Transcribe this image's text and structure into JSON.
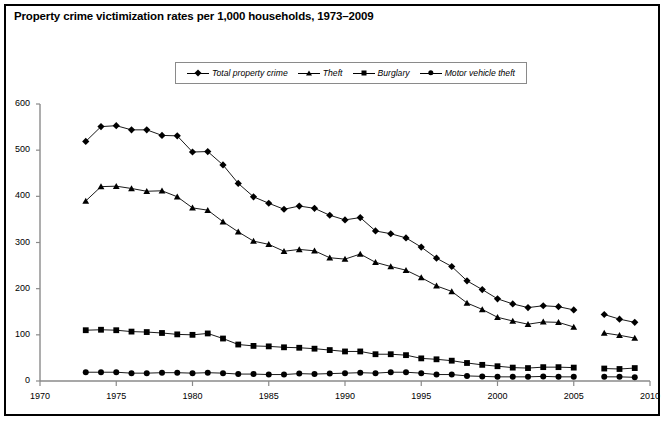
{
  "title": "Property crime victimization rates per 1,000 households, 1973–2009",
  "legend": {
    "items": [
      {
        "label": "Total property crime",
        "marker": "diamond"
      },
      {
        "label": "Theft",
        "marker": "triangle"
      },
      {
        "label": "Burglary",
        "marker": "square"
      },
      {
        "label": "Motor vehicle theft",
        "marker": "circle"
      }
    ]
  },
  "chart_data": {
    "type": "line",
    "title": "Property crime victimization rates per 1,000 households, 1973–2009",
    "xlabel": "",
    "ylabel": "",
    "xlim": [
      1970,
      2010
    ],
    "ylim": [
      0,
      600
    ],
    "xticks": [
      1970,
      1975,
      1980,
      1985,
      1990,
      1995,
      2000,
      2005,
      2010
    ],
    "yticks": [
      0,
      100,
      200,
      300,
      400,
      500,
      600
    ],
    "grid": false,
    "legend_position": "top",
    "note": "Series are broken between 2005 and 2007; a separate segment covers 2007–2009.",
    "x": [
      1973,
      1974,
      1975,
      1976,
      1977,
      1978,
      1979,
      1980,
      1981,
      1982,
      1983,
      1984,
      1985,
      1986,
      1987,
      1988,
      1989,
      1990,
      1991,
      1992,
      1993,
      1994,
      1995,
      1996,
      1997,
      1998,
      1999,
      2000,
      2001,
      2002,
      2003,
      2004,
      2005
    ],
    "x_segment2": [
      2007,
      2008,
      2009
    ],
    "series": [
      {
        "name": "Total property crime",
        "marker": "diamond",
        "values": [
          519,
          551,
          553,
          544,
          544,
          532,
          531,
          496,
          497,
          468,
          428,
          399,
          385,
          372,
          379,
          374,
          359,
          349,
          354,
          325,
          319,
          310,
          290,
          266,
          248,
          217,
          198,
          178,
          167,
          159,
          163,
          161,
          154
        ],
        "values_segment2": [
          144,
          134,
          127
        ]
      },
      {
        "name": "Theft",
        "marker": "triangle",
        "values": [
          390,
          421,
          422,
          417,
          411,
          412,
          399,
          375,
          370,
          345,
          323,
          303,
          296,
          281,
          285,
          282,
          267,
          264,
          275,
          257,
          248,
          240,
          224,
          206,
          194,
          169,
          155,
          138,
          130,
          123,
          128,
          127,
          117
        ],
        "values_segment2": [
          104,
          99,
          93
        ]
      },
      {
        "name": "Burglary",
        "marker": "square",
        "values": [
          110,
          111,
          110,
          107,
          106,
          104,
          101,
          100,
          103,
          92,
          79,
          76,
          75,
          73,
          72,
          70,
          67,
          64,
          64,
          58,
          58,
          56,
          49,
          47,
          44,
          39,
          35,
          32,
          29,
          28,
          30,
          30,
          29
        ],
        "values_segment2": [
          27,
          26,
          28
        ]
      },
      {
        "name": "Motor vehicle theft",
        "marker": "circle",
        "values": [
          19,
          19,
          19,
          17,
          17,
          18,
          18,
          17,
          18,
          17,
          15,
          15,
          14,
          14,
          16,
          15,
          16,
          17,
          18,
          17,
          19,
          19,
          17,
          14,
          14,
          11,
          10,
          9,
          9,
          9,
          10,
          9,
          9
        ],
        "values_segment2": [
          9,
          9,
          8
        ]
      }
    ]
  },
  "axes": {
    "y_tick_labels": [
      "0",
      "100",
      "200",
      "300",
      "400",
      "500",
      "600"
    ],
    "x_tick_labels": [
      "1970",
      "1975",
      "1980",
      "1985",
      "1990",
      "1995",
      "2000",
      "2005",
      "2010"
    ]
  }
}
